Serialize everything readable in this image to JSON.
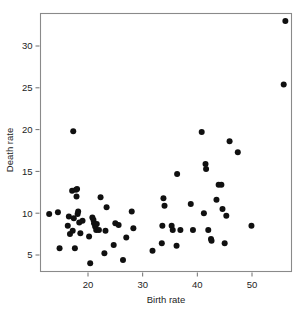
{
  "chart_data": {
    "type": "scatter",
    "title": "",
    "xlabel": "Birth rate",
    "ylabel": "Death rate",
    "xlim": [
      12,
      58
    ],
    "ylim": [
      3.2,
      34
    ],
    "grid": false,
    "legend": false,
    "marker": {
      "shape": "circle",
      "color": "#101010",
      "size": 3.0
    },
    "xticks": [
      20,
      30,
      40,
      50
    ],
    "yticks": [
      5,
      10,
      15,
      20,
      25,
      30
    ],
    "xtick_labels": [
      "20",
      "30",
      "40",
      "50"
    ],
    "ytick_labels": [
      "5",
      "10",
      "15",
      "20",
      "25",
      "30"
    ],
    "n_points": 70,
    "points": [
      [
        12.9,
        9.9
      ],
      [
        14.5,
        10.1
      ],
      [
        14.8,
        5.8
      ],
      [
        16.3,
        8.5
      ],
      [
        16.5,
        9.6
      ],
      [
        16.7,
        7.5
      ],
      [
        17.1,
        12.7
      ],
      [
        17.2,
        7.9
      ],
      [
        17.3,
        19.8
      ],
      [
        17.4,
        9.4
      ],
      [
        17.6,
        5.8
      ],
      [
        17.8,
        12.8
      ],
      [
        17.9,
        12.0
      ],
      [
        18.0,
        12.9
      ],
      [
        18.1,
        9.9
      ],
      [
        18.2,
        10.2
      ],
      [
        18.4,
        8.9
      ],
      [
        18.6,
        7.6
      ],
      [
        19.0,
        9.1
      ],
      [
        20.2,
        7.2
      ],
      [
        20.4,
        4.0
      ],
      [
        20.8,
        9.5
      ],
      [
        21.0,
        9.2
      ],
      [
        21.1,
        8.8
      ],
      [
        21.3,
        8.4
      ],
      [
        21.5,
        8.0
      ],
      [
        21.6,
        8.7
      ],
      [
        22.0,
        8.0
      ],
      [
        22.3,
        11.9
      ],
      [
        23.0,
        5.2
      ],
      [
        23.2,
        7.9
      ],
      [
        23.4,
        10.7
      ],
      [
        24.7,
        6.2
      ],
      [
        25.0,
        8.8
      ],
      [
        25.6,
        8.6
      ],
      [
        26.4,
        4.4
      ],
      [
        27.0,
        7.1
      ],
      [
        28.0,
        10.2
      ],
      [
        28.3,
        8.2
      ],
      [
        31.8,
        5.5
      ],
      [
        33.5,
        6.4
      ],
      [
        33.6,
        8.5
      ],
      [
        33.8,
        11.8
      ],
      [
        34.0,
        10.9
      ],
      [
        35.3,
        8.5
      ],
      [
        35.5,
        8.0
      ],
      [
        36.2,
        6.1
      ],
      [
        36.3,
        14.7
      ],
      [
        36.9,
        8.0
      ],
      [
        38.8,
        11.1
      ],
      [
        39.2,
        8.0
      ],
      [
        40.8,
        19.7
      ],
      [
        41.2,
        10.0
      ],
      [
        41.5,
        15.9
      ],
      [
        41.6,
        15.3
      ],
      [
        42.0,
        8.0
      ],
      [
        42.5,
        6.9
      ],
      [
        42.6,
        6.7
      ],
      [
        43.5,
        11.6
      ],
      [
        43.9,
        13.4
      ],
      [
        44.4,
        13.4
      ],
      [
        44.6,
        10.5
      ],
      [
        45.0,
        6.4
      ],
      [
        45.3,
        9.7
      ],
      [
        45.9,
        18.6
      ],
      [
        47.4,
        17.3
      ],
      [
        49.9,
        8.5
      ],
      [
        55.8,
        25.4
      ],
      [
        56.1,
        33.0
      ]
    ]
  }
}
